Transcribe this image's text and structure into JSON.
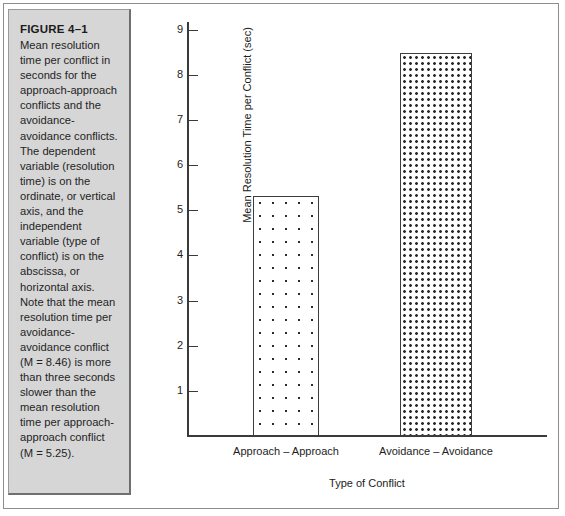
{
  "figure": {
    "title": "FIGURE 4–1",
    "caption": "Mean resolution time per conflict in seconds for the approach-approach conflicts and the avoidance-avoidance conflicts. The dependent variable (resolution time) is on the ordinate, or vertical axis, and the independent variable (type of conflict) is on the abscissa, or horizontal axis. Note that the mean resolution time per avoidance-avoidance conflict (M = 8.46) is more than three seconds slower than the mean resolution time per approach-approach conflict (M = 5.25)."
  },
  "chart_data": {
    "type": "bar",
    "title": "",
    "categories": [
      "Approach – Approach",
      "Avoidance – Avoidance"
    ],
    "values": [
      5.2,
      8.3
    ],
    "xlabel": "Type of Conflict",
    "ylabel": "Mean Resolution Time per Conflict (sec)",
    "ylim": [
      0,
      9
    ],
    "yticks": [
      1,
      2,
      3,
      4,
      5,
      6,
      7,
      8,
      9
    ],
    "ytick_labels": [
      "1",
      "2",
      "3",
      "4",
      "5",
      "6",
      "7",
      "8",
      "9"
    ],
    "grid": false,
    "legend": false,
    "series": [
      {
        "name": "Mean resolution time",
        "values": [
          5.2,
          8.3
        ]
      }
    ],
    "bar_fills": [
      "sparse-dot-pattern",
      "dense-dot-pattern"
    ],
    "colors": {
      "axis": "#3a3a3a",
      "bar_outline": "#3d3d3d",
      "bar_fill": "#ffffff",
      "pattern": "#2b2b2b",
      "caption_panel": "#d6d6d6",
      "frame": "#8d8d8d"
    }
  }
}
